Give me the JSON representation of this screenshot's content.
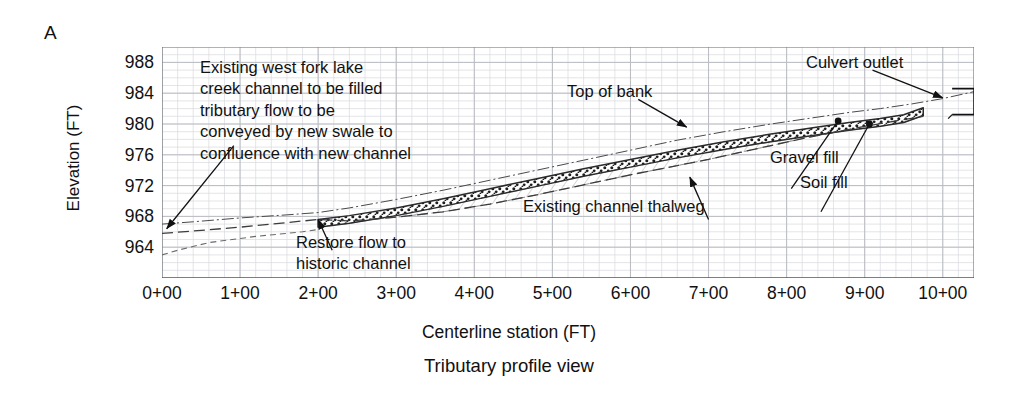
{
  "panel": {
    "label": "A"
  },
  "axes": {
    "y_title": "Elevation (FT)",
    "x_title": "Centerline station (FT)"
  },
  "caption": "Tributary profile view",
  "annotations": {
    "existing_channel": "Existing west fork lake\ncreek channel to be filled\ntributary flow to be\nconveyed by new swale to\nconfluence with new channel",
    "restore_flow": "Restore flow to\nhistoric channel",
    "top_of_bank": "Top of bank",
    "existing_thalweg": "Existing channel thalweg",
    "gravel_fill": "Gravel fill",
    "soil_fill": "Soil fill",
    "culvert_outlet": "Culvert outlet"
  },
  "colors": {
    "ink": "#111111",
    "grid_major": "#b9bcc2",
    "grid_minor": "#d8dade",
    "frame": "#6f7378",
    "gravel": "#2b2b2b",
    "soil": "#7d7d7d",
    "background": "#ffffff"
  },
  "chart_data": {
    "type": "line",
    "title": "Tributary profile view",
    "xlabel": "Centerline station (FT)",
    "ylabel": "Elevation (FT)",
    "xlim": [
      0,
      1040
    ],
    "ylim": [
      960,
      990
    ],
    "grid": true,
    "legend": "none",
    "x_tick_labels": [
      "0+00",
      "1+00",
      "2+00",
      "3+00",
      "4+00",
      "5+00",
      "6+00",
      "7+00",
      "8+00",
      "9+00",
      "10+00"
    ],
    "x_tick_values": [
      0,
      100,
      200,
      300,
      400,
      500,
      600,
      700,
      800,
      900,
      1000
    ],
    "y_tick_labels": [
      "964",
      "968",
      "972",
      "976",
      "980",
      "984",
      "988"
    ],
    "y_tick_values": [
      964,
      968,
      972,
      976,
      980,
      984,
      988
    ],
    "y_minor_step": 1,
    "x_minor_step": 20,
    "series": [
      {
        "name": "Top of bank",
        "style": "dash-dot thin",
        "x": [
          0,
          40,
          100,
          160,
          200,
          240,
          300,
          360,
          420,
          480,
          540,
          600,
          660,
          720,
          780,
          840,
          880,
          920,
          960,
          1000,
          1040
        ],
        "y": [
          967.0,
          967.3,
          967.8,
          968.2,
          968.5,
          969.1,
          970.2,
          971.4,
          972.7,
          974.0,
          975.3,
          976.6,
          977.9,
          979.0,
          980.0,
          980.9,
          981.5,
          982.0,
          982.6,
          983.3,
          984.2
        ]
      },
      {
        "name": "Proposed channel invert (gravel fill top)",
        "style": "stipple band upper edge",
        "x": [
          200,
          240,
          300,
          360,
          420,
          480,
          540,
          600,
          660,
          720,
          780,
          840,
          880,
          920,
          950,
          975
        ],
        "y": [
          967.6,
          968.1,
          969.1,
          970.3,
          971.6,
          972.9,
          974.2,
          975.4,
          976.6,
          977.7,
          978.7,
          979.6,
          980.2,
          980.7,
          981.2,
          982.1
        ]
      },
      {
        "name": "Gravel fill band base",
        "style": "stipple band lower edge",
        "x": [
          200,
          240,
          300,
          360,
          420,
          480,
          540,
          600,
          660,
          720,
          780,
          840,
          880,
          920,
          950,
          975
        ],
        "y": [
          966.6,
          967.1,
          968.1,
          969.3,
          970.6,
          971.9,
          973.2,
          974.4,
          975.6,
          976.7,
          977.7,
          978.6,
          979.2,
          979.7,
          980.2,
          981.1
        ]
      },
      {
        "name": "Existing channel thalweg",
        "style": "long dash",
        "x": [
          0,
          40,
          100,
          160,
          200,
          240,
          300,
          360,
          420,
          480,
          540,
          600,
          660,
          700,
          740,
          780,
          820,
          860,
          900,
          940,
          975
        ],
        "y": [
          965.8,
          966.1,
          966.6,
          967.2,
          967.6,
          967.4,
          967.9,
          968.6,
          969.6,
          970.8,
          972.1,
          973.4,
          974.6,
          975.4,
          976.3,
          977.2,
          978.1,
          978.9,
          979.7,
          980.4,
          981.0
        ]
      },
      {
        "name": "Lower dashed profile (historic channel)",
        "style": "short dash",
        "x": [
          0,
          20,
          60,
          120,
          180,
          200
        ],
        "y": [
          963.0,
          963.6,
          964.6,
          965.4,
          966.0,
          966.3
        ]
      }
    ],
    "annotations": [
      {
        "text": "Existing west fork lake creek channel to be filled tributary flow to be conveyed by new swale to confluence with new channel",
        "x": 20,
        "y": 966.5
      },
      {
        "text": "Restore flow to historic channel",
        "x": 210,
        "y": 968.2
      },
      {
        "text": "Top of bank",
        "x": 660,
        "y": 978.8
      },
      {
        "text": "Existing channel thalweg",
        "x": 700,
        "y": 975.5
      },
      {
        "text": "Gravel fill",
        "x": 880,
        "y": 980.4
      },
      {
        "text": "Soil fill",
        "x": 915,
        "y": 980.0
      },
      {
        "text": "Culvert outlet",
        "x": 1005,
        "y": 983.6
      }
    ]
  }
}
